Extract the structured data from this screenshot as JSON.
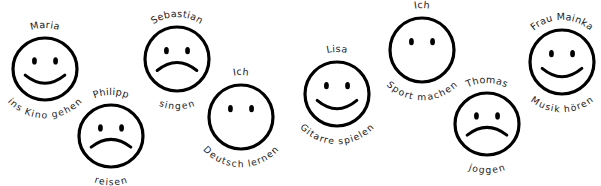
{
  "worksheet": {
    "title": "Smiley faces with names and activities",
    "background_color": "#ffffff",
    "ink_color": "#000000",
    "width": 601,
    "height": 186
  },
  "faces": [
    {
      "id": "maria",
      "name": "Maria",
      "activity": "ins Kino gehen",
      "mood": "happy",
      "cx": 45,
      "cy": 69,
      "rx": 32,
      "ry": 31,
      "name_sweep": 1,
      "activity_sweep": 0,
      "name_offset": 10,
      "activity_offset": 11
    },
    {
      "id": "philipp",
      "name": "Philipp",
      "activity": "reisen",
      "mood": "sad",
      "cx": 111,
      "cy": 136,
      "rx": 32,
      "ry": 31,
      "name_sweep": 1,
      "activity_sweep": 0,
      "name_offset": 10,
      "activity_offset": 11
    },
    {
      "id": "sebastian",
      "name": "Sebastian",
      "activity": "singen",
      "mood": "sad",
      "cx": 177,
      "cy": 59,
      "rx": 32,
      "ry": 32,
      "name_sweep": 1,
      "activity_sweep": 0,
      "name_offset": 10,
      "activity_offset": 11
    },
    {
      "id": "ich-deutsch",
      "name": "Ich",
      "activity": "Deutsch lernen",
      "mood": "neutral",
      "cx": 241,
      "cy": 117,
      "rx": 32,
      "ry": 32,
      "name_sweep": 1,
      "activity_sweep": 0,
      "name_offset": 10,
      "activity_offset": 11
    },
    {
      "id": "lisa",
      "name": "Lisa",
      "activity": "Gitarre spielen",
      "mood": "happy",
      "cx": 337,
      "cy": 94,
      "rx": 32,
      "ry": 32,
      "name_sweep": 1,
      "activity_sweep": 0,
      "name_offset": 10,
      "activity_offset": 11
    },
    {
      "id": "ich-sport",
      "name": "Ich",
      "activity": "Sport machen",
      "mood": "neutral",
      "cx": 422,
      "cy": 50,
      "rx": 32,
      "ry": 32,
      "name_sweep": 1,
      "activity_sweep": 0,
      "name_offset": 10,
      "activity_offset": 11
    },
    {
      "id": "thomas",
      "name": "Thomas",
      "activity": "joggen",
      "mood": "sad",
      "cx": 487,
      "cy": 124,
      "rx": 32,
      "ry": 31,
      "name_sweep": 1,
      "activity_sweep": 0,
      "name_offset": 10,
      "activity_offset": 11
    },
    {
      "id": "frau-mainka",
      "name": "Frau Mainka",
      "activity": "Musik hören",
      "mood": "happy",
      "cx": 562,
      "cy": 62,
      "rx": 32,
      "ry": 32,
      "name_sweep": 1,
      "activity_sweep": 0,
      "name_offset": 10,
      "activity_offset": 11
    }
  ]
}
